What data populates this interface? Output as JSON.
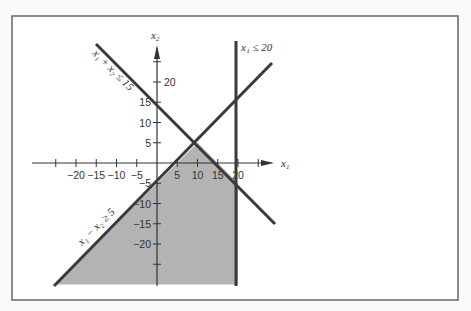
{
  "figure": {
    "frame": {
      "x": 12,
      "y": 16,
      "width": 446,
      "height": 284,
      "stroke": "#666666"
    },
    "colors": {
      "feasible_fill": "#b3b3b3",
      "line": "#3a3a3a",
      "axis": "#333333",
      "background": "#fafafa"
    },
    "origin_px": {
      "x": 157,
      "y": 163
    },
    "scale_px_per_unit": 4.05,
    "axes": {
      "x_label": "x",
      "x_label_sub": "1",
      "y_label": "x",
      "y_label_sub": "2",
      "x_ticks": [
        {
          "value": -25,
          "label": ""
        },
        {
          "value": -20,
          "label": "−20"
        },
        {
          "value": -15,
          "label": "−15"
        },
        {
          "value": -10,
          "label": "−10"
        },
        {
          "value": -5,
          "label": "−5"
        },
        {
          "value": 5,
          "label": "5"
        },
        {
          "value": 10,
          "label": "10"
        },
        {
          "value": 15,
          "label": "15"
        },
        {
          "value": 20,
          "label": "20"
        },
        {
          "value": 25,
          "label": ""
        }
      ],
      "y_ticks": [
        {
          "value": 25,
          "label": ""
        },
        {
          "value": 20,
          "label": "20"
        },
        {
          "value": 15,
          "label": "15"
        },
        {
          "value": 10,
          "label": "10"
        },
        {
          "value": 5,
          "label": "5"
        },
        {
          "value": -5,
          "label": "−5"
        },
        {
          "value": -10,
          "label": "−10"
        },
        {
          "value": -15,
          "label": "−15"
        },
        {
          "value": -20,
          "label": "−20"
        },
        {
          "value": -25,
          "label": ""
        }
      ]
    },
    "constraints": [
      {
        "id": "c1",
        "label": "x₁ + x₂ ≤ 15",
        "equation": "x1 + x2 = 15"
      },
      {
        "id": "c2",
        "label": "x₁ − x₂ ≥ 5",
        "equation": "x1 - x2 = 5"
      },
      {
        "id": "c3",
        "label": "x₁ ≤ 20",
        "equation": "x1 = 20"
      }
    ],
    "feasible_region": {
      "description": "Unbounded region below both x1+x2<=15 and x1-x2>=5, left of x1=20",
      "vertices": [
        [
          10,
          5
        ],
        [
          20,
          -5
        ],
        [
          20,
          -30
        ],
        [
          -25,
          -30
        ]
      ]
    }
  }
}
